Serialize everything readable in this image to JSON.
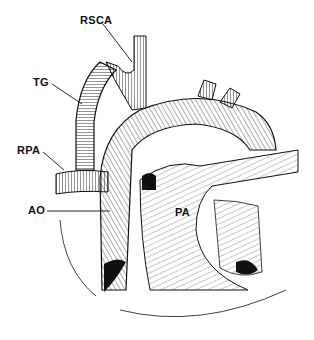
{
  "figure": {
    "type": "anatomical-illustration",
    "labels": [
      {
        "id": "rsca",
        "text": "RSCA",
        "x": 80,
        "y": 14
      },
      {
        "id": "tg",
        "text": "TG",
        "x": 33,
        "y": 76
      },
      {
        "id": "rpa",
        "text": "RPA",
        "x": 17,
        "y": 144
      },
      {
        "id": "ao",
        "text": "AO",
        "x": 28,
        "y": 206
      },
      {
        "id": "pa",
        "text": "PA",
        "x": 175,
        "y": 206
      }
    ]
  }
}
